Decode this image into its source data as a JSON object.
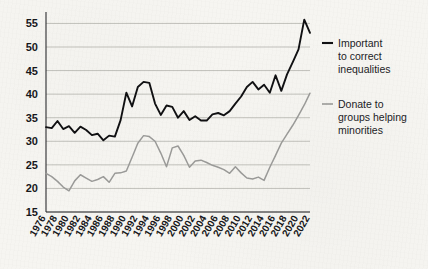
{
  "chart_data": {
    "type": "line",
    "title": "",
    "subtitle": "",
    "xlabel": "",
    "ylabel": "",
    "xlim": [
      1976,
      2022
    ],
    "ylim": [
      15,
      57
    ],
    "yticks": [
      15,
      20,
      25,
      30,
      35,
      40,
      45,
      50,
      55
    ],
    "ytick_labels": [
      "15",
      "20",
      "25",
      "30",
      "35",
      "40",
      "45",
      "50",
      "55"
    ],
    "xticks": [
      1976,
      1978,
      1980,
      1982,
      1984,
      1986,
      1988,
      1990,
      1992,
      1994,
      1996,
      1998,
      2000,
      2002,
      2004,
      2006,
      2008,
      2010,
      2012,
      2014,
      2016,
      2018,
      2020,
      2022
    ],
    "xtick_labels": [
      "1976",
      "1978",
      "1980",
      "1982",
      "1984",
      "1986",
      "1988",
      "1990",
      "1992",
      "1994",
      "1996",
      "1998",
      "2000",
      "2002",
      "2004",
      "2006",
      "2008",
      "2010",
      "2012",
      "2014",
      "2016",
      "2018",
      "2020",
      "2022"
    ],
    "grid": true,
    "grid_axis": "y",
    "legend_position": "right",
    "x": [
      1976,
      1977,
      1978,
      1979,
      1980,
      1981,
      1982,
      1983,
      1984,
      1985,
      1986,
      1987,
      1988,
      1989,
      1990,
      1991,
      1992,
      1993,
      1994,
      1995,
      1996,
      1997,
      1998,
      1999,
      2000,
      2001,
      2002,
      2003,
      2004,
      2005,
      2006,
      2007,
      2008,
      2009,
      2010,
      2011,
      2012,
      2013,
      2014,
      2015,
      2016,
      2017,
      2018,
      2019,
      2020,
      2021,
      2022
    ],
    "series": [
      {
        "name": "Important to correct inequalities",
        "color": "#101012",
        "values": [
          33.0,
          32.8,
          34.3,
          32.6,
          33.2,
          31.8,
          33.1,
          32.4,
          31.3,
          31.6,
          30.2,
          31.2,
          31.0,
          34.5,
          40.3,
          37.4,
          41.5,
          42.6,
          42.4,
          38.0,
          35.6,
          37.6,
          37.3,
          35.0,
          36.4,
          34.5,
          35.3,
          34.4,
          34.4,
          35.7,
          36.0,
          35.5,
          36.4,
          38.0,
          39.5,
          41.5,
          42.6,
          41.0,
          42.0,
          40.3,
          44.0,
          40.7,
          44.2,
          46.8,
          49.5,
          55.8,
          53.0
        ]
      },
      {
        "name": "Donate to groups helping minorities",
        "color": "#9a9a98",
        "values": [
          23.2,
          22.5,
          21.5,
          20.3,
          19.5,
          21.6,
          22.9,
          22.2,
          21.5,
          21.9,
          22.5,
          21.3,
          23.2,
          23.3,
          23.7,
          26.6,
          29.6,
          31.2,
          31.0,
          30.0,
          27.5,
          24.6,
          28.6,
          29.0,
          27.0,
          24.5,
          25.8,
          26.0,
          25.5,
          24.9,
          24.5,
          24.0,
          23.2,
          24.6,
          23.3,
          22.2,
          22.0,
          22.4,
          21.7,
          24.5,
          27.0,
          29.6,
          31.5,
          33.4,
          35.5,
          37.7,
          40.2
        ]
      }
    ]
  },
  "legend": {
    "entries": [
      {
        "label_line1": "Important",
        "label_line2": "to correct",
        "label_line3": "inequalities",
        "color": "#101012"
      },
      {
        "label_line1": "Donate to",
        "label_line2": "groups helping",
        "label_line3": "minorities",
        "color": "#9a9a98"
      }
    ]
  }
}
